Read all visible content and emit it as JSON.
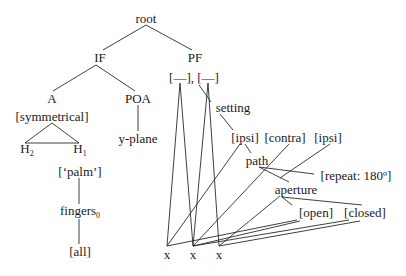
{
  "diagram": {
    "type": "feature-geometry-tree",
    "colors": {
      "line": "#2a2a2a",
      "text": "#1a1a1a",
      "background": "#ffffff"
    },
    "nodes": {
      "root": {
        "label": "root",
        "x": 146,
        "y": 18
      },
      "if": {
        "label": "IF",
        "x": 100,
        "y": 57
      },
      "pf": {
        "label": "PF",
        "x": 195,
        "y": 57
      },
      "timing_slots": {
        "label": "[—], [—]",
        "x": 194,
        "y": 77
      },
      "a": {
        "label": "A",
        "x": 52,
        "y": 98
      },
      "poa": {
        "label": "POA",
        "x": 138,
        "y": 98
      },
      "symmetrical": {
        "label": "[symmetrical]",
        "x": 52,
        "y": 116
      },
      "setting": {
        "label": "setting",
        "x": 233,
        "y": 107
      },
      "h2": {
        "label": "H",
        "sub": "2",
        "x": 27,
        "y": 150
      },
      "h1": {
        "label": "H",
        "sub": "1",
        "x": 80,
        "y": 150
      },
      "y_plane": {
        "label": "y-plane",
        "x": 138,
        "y": 138
      },
      "ipsi_1": {
        "label": "[ipsi]",
        "x": 245,
        "y": 137
      },
      "contra": {
        "label": "[contra]",
        "x": 285,
        "y": 137
      },
      "ipsi_2": {
        "label": "[ipsi]",
        "x": 328,
        "y": 137
      },
      "path": {
        "label": "path",
        "x": 257,
        "y": 160
      },
      "repeat": {
        "label": "[repeat: 180º]",
        "x": 356,
        "y": 175
      },
      "palm": {
        "label": "[‘palm’]",
        "x": 80,
        "y": 171
      },
      "aperture": {
        "label": "aperture",
        "x": 296,
        "y": 189
      },
      "fingers": {
        "label": "fingers",
        "sub": "0",
        "x": 80,
        "y": 212
      },
      "open": {
        "label": "[open]",
        "x": 316,
        "y": 212
      },
      "closed": {
        "label": "[closed]",
        "x": 365,
        "y": 212
      },
      "all": {
        "label": "[all]",
        "x": 80,
        "y": 251
      },
      "x1": {
        "label": "x",
        "x": 167,
        "y": 254
      },
      "x2": {
        "label": "x",
        "x": 193,
        "y": 254
      },
      "x3": {
        "label": "x",
        "x": 219,
        "y": 254
      }
    },
    "edges": [
      {
        "from": "root",
        "to": "if",
        "x1": 146,
        "y1": 25,
        "x2": 103,
        "y2": 50
      },
      {
        "from": "root",
        "to": "pf",
        "x1": 146,
        "y1": 25,
        "x2": 192,
        "y2": 50
      },
      {
        "from": "if",
        "to": "a",
        "x1": 96,
        "y1": 65,
        "x2": 53,
        "y2": 91
      },
      {
        "from": "if",
        "to": "poa",
        "x1": 96,
        "y1": 65,
        "x2": 135,
        "y2": 91
      },
      {
        "from": "poa",
        "to": "y-plane",
        "x1": 138,
        "y1": 105,
        "x2": 138,
        "y2": 131
      },
      {
        "from": "symmetrical",
        "to": "h2",
        "x1": 52,
        "y1": 123,
        "x2": 25,
        "y2": 143
      },
      {
        "from": "symmetrical",
        "to": "h1",
        "x1": 52,
        "y1": 123,
        "x2": 79,
        "y2": 143
      },
      {
        "from": "h2",
        "to": "h1",
        "x1": 25,
        "y1": 143,
        "x2": 79,
        "y2": 143
      },
      {
        "from": "palm",
        "to": "fingers",
        "x1": 79,
        "y1": 178,
        "x2": 79,
        "y2": 204
      },
      {
        "from": "fingers",
        "to": "all",
        "x1": 79,
        "y1": 219,
        "x2": 79,
        "y2": 244
      },
      {
        "from": "slot1",
        "to": "x1",
        "x1": 180,
        "y1": 83,
        "x2": 167,
        "y2": 246
      },
      {
        "from": "slot1",
        "to": "x2",
        "x1": 180,
        "y1": 83,
        "x2": 193,
        "y2": 246
      },
      {
        "from": "slot2",
        "to": "x2",
        "x1": 208,
        "y1": 83,
        "x2": 193,
        "y2": 246
      },
      {
        "from": "slot2",
        "to": "x3",
        "x1": 208,
        "y1": 83,
        "x2": 219,
        "y2": 246
      },
      {
        "from": "timing_slots",
        "to": "setting",
        "x1": 199,
        "y1": 85,
        "x2": 211,
        "y2": 102
      },
      {
        "from": "setting",
        "to": "ipsi_1",
        "x1": 220,
        "y1": 114,
        "x2": 233,
        "y2": 130
      },
      {
        "from": "ipsi_1",
        "to": "path",
        "x1": 245,
        "y1": 144,
        "x2": 251,
        "y2": 153
      },
      {
        "from": "ipsi_1",
        "to": "x1",
        "x1": 240,
        "y1": 144,
        "x2": 167,
        "y2": 246
      },
      {
        "from": "contra",
        "to": "x2",
        "x1": 289,
        "y1": 144,
        "x2": 193,
        "y2": 246
      },
      {
        "from": "ipsi_2",
        "to": "x3",
        "x1": 330,
        "y1": 144,
        "x2": 280,
        "y2": 178
      },
      {
        "from": "path",
        "to": "repeat",
        "x1": 259,
        "y1": 167,
        "x2": 314,
        "y2": 174
      },
      {
        "from": "path",
        "to": "aperture",
        "x1": 259,
        "y1": 167,
        "x2": 289,
        "y2": 182
      },
      {
        "from": "aperture",
        "to": "x3",
        "x1": 280,
        "y1": 196,
        "x2": 219,
        "y2": 246
      },
      {
        "from": "aperture",
        "to": "open",
        "x1": 282,
        "y1": 197,
        "x2": 292,
        "y2": 205
      },
      {
        "from": "aperture",
        "to": "closed",
        "x1": 282,
        "y1": 197,
        "x2": 362,
        "y2": 205
      },
      {
        "from": "open",
        "to": "x1",
        "x1": 297,
        "y1": 220,
        "x2": 167,
        "y2": 246
      },
      {
        "from": "open",
        "to": "x2",
        "x1": 300,
        "y1": 221,
        "x2": 193,
        "y2": 246
      },
      {
        "from": "closed",
        "to": "x2",
        "x1": 349,
        "y1": 220,
        "x2": 193,
        "y2": 246
      },
      {
        "from": "closed",
        "to": "x3",
        "x1": 360,
        "y1": 221,
        "x2": 219,
        "y2": 246
      }
    ]
  }
}
